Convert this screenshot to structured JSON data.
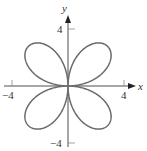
{
  "chart_data": {
    "type": "line",
    "title": "",
    "curve": "polar rose r = 4 sin(2θ)",
    "equation_hint": "r = 4 sin 2θ",
    "xlabel": "x",
    "ylabel": "y",
    "xlim": [
      -4.8,
      4.8
    ],
    "ylim": [
      -4.5,
      4.5
    ],
    "x_ticks": [
      -4,
      4
    ],
    "y_ticks": [
      4,
      -4
    ],
    "x_tick_labels": [
      "−4",
      "4"
    ],
    "y_tick_labels": [
      "4",
      "−4"
    ],
    "petals": 4,
    "petal_max_r": 4,
    "grid": false,
    "legend": null,
    "colors": {
      "curve": "#6b6b6b",
      "axis": "#3a3a3a"
    }
  },
  "labels": {
    "x_axis": "x",
    "y_axis": "y",
    "x_neg": "−4",
    "x_pos": "4",
    "y_pos": "4",
    "y_neg": "−4"
  }
}
